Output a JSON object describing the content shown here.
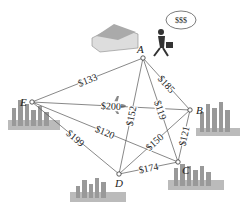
{
  "diagram": {
    "type": "weighted-complete-graph",
    "nodes": [
      {
        "id": "A",
        "label": "A",
        "x": 143,
        "y": 58
      },
      {
        "id": "B",
        "label": "B",
        "x": 190,
        "y": 110
      },
      {
        "id": "C",
        "label": "C",
        "x": 178,
        "y": 162
      },
      {
        "id": "D",
        "label": "D",
        "x": 119,
        "y": 174
      },
      {
        "id": "E",
        "label": "E",
        "x": 32,
        "y": 102
      }
    ],
    "edges": [
      {
        "from": "A",
        "to": "E",
        "weight": "$133"
      },
      {
        "from": "A",
        "to": "B",
        "weight": "$185"
      },
      {
        "from": "A",
        "to": "C",
        "weight": "$119"
      },
      {
        "from": "A",
        "to": "D",
        "weight": "$152"
      },
      {
        "from": "E",
        "to": "B",
        "weight": "$200"
      },
      {
        "from": "E",
        "to": "C",
        "weight": "$120"
      },
      {
        "from": "E",
        "to": "D",
        "weight": "$199"
      },
      {
        "from": "D",
        "to": "B",
        "weight": "$150"
      },
      {
        "from": "B",
        "to": "C",
        "weight": "$121"
      },
      {
        "from": "D",
        "to": "C",
        "weight": "$174"
      }
    ],
    "thought_bubble": "$$$"
  }
}
